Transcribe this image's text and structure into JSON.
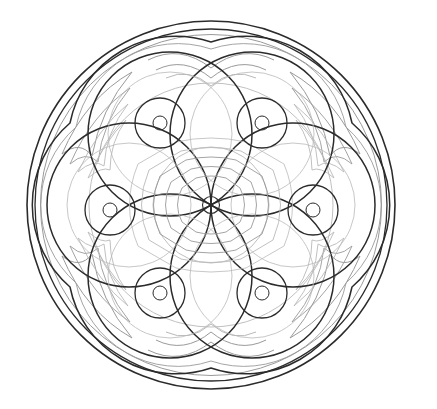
{
  "artwork": {
    "title": "Circular Mandala Coloring Page",
    "type": "line-art",
    "style": "flower-of-life mandala",
    "background_color": "#ffffff",
    "canvas": {
      "width": 437,
      "height": 409
    }
  },
  "palette": {
    "ink_dark": "#2b2b2b",
    "ink_mid": "#555555",
    "ink_light": "#9a9a9a",
    "ink_faint": "#b9b9b9",
    "paper": "#ffffff"
  },
  "geometry": {
    "center": {
      "cx": 211,
      "cy": 205
    },
    "outer_rim": {
      "outer_radius": 184,
      "inner_radius": 176,
      "accent_radius": 170,
      "stroke_outer": "#2b2b2b",
      "stroke_inner": "#2b2b2b",
      "stroke_accent": "#9a9a9a"
    },
    "scallop_ring": {
      "radius": 163,
      "lobes": 6,
      "lobe_depth": 13,
      "stroke": "#2b2b2b"
    },
    "petal_ring": {
      "count": 6,
      "petal_radius": 82,
      "ring_offset": 82,
      "start_angle_deg": -60,
      "stroke": "#2b2b2b"
    },
    "hub_circles": {
      "count": 6,
      "outer_radius": 25,
      "inner_radius": 7,
      "stroke": "#2b2b2b"
    },
    "center_hub": {
      "dot_radius": 8,
      "hexagon_rings": [
        18,
        28,
        38,
        48,
        58
      ],
      "stroke": "#9a9a9a"
    },
    "corner_flourishes": {
      "count": 4,
      "angles_deg": [
        135,
        45,
        225,
        315
      ],
      "feather_strokes": 4,
      "stroke": "#9a9a9a"
    },
    "crest_arcs": {
      "positions": [
        "top",
        "bottom"
      ],
      "arc_count": 3,
      "stroke": "#9a9a9a"
    }
  },
  "elements": {
    "outer_ring_label": "outer rim",
    "scallop_label": "scalloped band",
    "petal_label": "overlapping petal circle",
    "hub_label": "petal hub circle",
    "center_label": "central hexagon rosette",
    "flourish_label": "corner feather flourish",
    "crest_label": "crest arc cluster"
  }
}
